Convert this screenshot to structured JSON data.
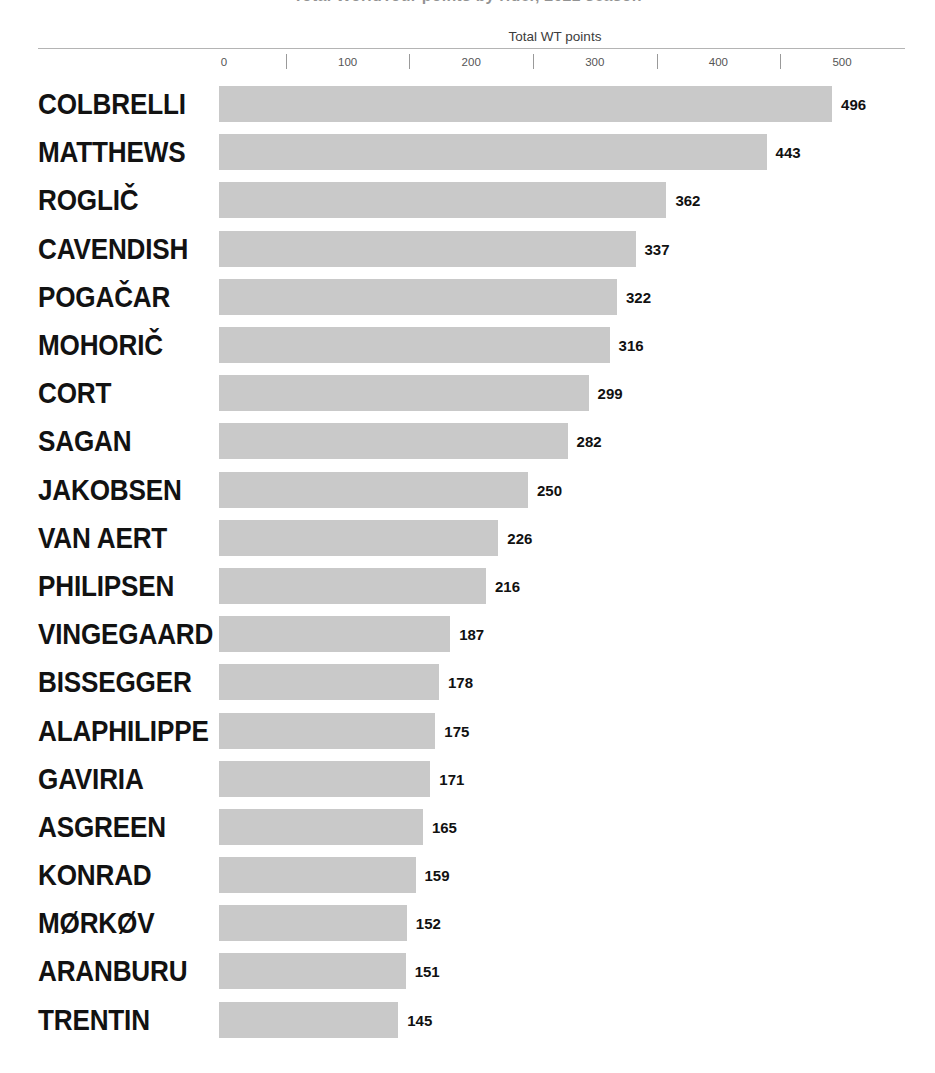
{
  "header": {
    "clipped_title": "Total WorldTour points by rider, 2021 season",
    "axis_title": "Total WT points"
  },
  "axis": {
    "ticks": [
      {
        "label": "0",
        "value": 0
      },
      {
        "label": "100",
        "value": 100
      },
      {
        "label": "200",
        "value": 200
      },
      {
        "label": "300",
        "value": 300
      },
      {
        "label": "400",
        "value": 400
      },
      {
        "label": "500",
        "value": 500
      }
    ],
    "min": 0,
    "max": 500,
    "minor_ticks": [
      50,
      150,
      250,
      350,
      450
    ]
  },
  "style": {
    "bar_color": "#c9c9c9",
    "label_color": "#121212",
    "axis_rule_color": "#b4b4b4",
    "tick_text_color": "#555555",
    "background": "#ffffff"
  },
  "chart_data": {
    "type": "bar",
    "orientation": "horizontal",
    "title": "Total WorldTour points by rider, 2021 season",
    "xlabel": "Total WT points",
    "ylabel": "",
    "xlim": [
      0,
      500
    ],
    "grid": false,
    "legend": "none",
    "value_labels": true,
    "sorted": "descending",
    "categories": [
      "COLBRELLI",
      "MATTHEWS",
      "ROGLIČ",
      "CAVENDISH",
      "POGAČAR",
      "MOHORIČ",
      "CORT",
      "SAGAN",
      "JAKOBSEN",
      "VAN AERT",
      "PHILIPSEN",
      "VINGEGAARD",
      "BISSEGGER",
      "ALAPHILIPPE",
      "GAVIRIA",
      "ASGREEN",
      "KONRAD",
      "MØRKØV",
      "ARANBURU",
      "TRENTIN"
    ],
    "values": [
      496,
      443,
      362,
      337,
      322,
      316,
      299,
      282,
      250,
      226,
      216,
      187,
      178,
      175,
      171,
      165,
      159,
      152,
      151,
      145
    ],
    "xticks": [
      0,
      100,
      200,
      300,
      400,
      500
    ],
    "xticklabels": [
      "0",
      "100",
      "200",
      "300",
      "400",
      "500"
    ]
  }
}
